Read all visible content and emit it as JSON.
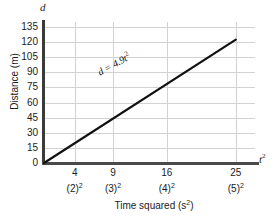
{
  "chart_data": {
    "type": "line",
    "title": "",
    "xlabel": "Time squared (s²)",
    "ylabel": "Distance (m)",
    "x_axis_symbol": "t",
    "x_axis_symbol_exponent": "2",
    "y_axis_symbol": "d",
    "xlim": [
      0,
      27.5
    ],
    "ylim": [
      0,
      140
    ],
    "grid": true,
    "legend": "none",
    "annotation": "d = 4.9t²",
    "annotation_parts": {
      "variable": "d",
      "equals": " = ",
      "coefficient": "4.9",
      "term": "t",
      "exponent": "2"
    },
    "x_ticks": [
      {
        "value": 4,
        "primary": "4",
        "secondary": "(2)",
        "secondary_exponent": "2"
      },
      {
        "value": 9,
        "primary": "9",
        "secondary": "(3)",
        "secondary_exponent": "2"
      },
      {
        "value": 16,
        "primary": "16",
        "secondary": "(4)",
        "secondary_exponent": "2"
      },
      {
        "value": 25,
        "primary": "25",
        "secondary": "(5)",
        "secondary_exponent": "2"
      }
    ],
    "y_ticks": [
      0,
      15,
      30,
      45,
      60,
      75,
      90,
      105,
      120,
      135
    ],
    "series": [
      {
        "name": "d = 4.9t²",
        "x": [
          0,
          25
        ],
        "y": [
          0,
          122.5
        ],
        "color": "#111111",
        "linewidth": 2.2
      }
    ],
    "colors": {
      "line": "#111111",
      "grid": "#d2d2d2",
      "axis": "#3a3a3a",
      "text": "#1c1c1c",
      "background": "#ffffff"
    }
  }
}
